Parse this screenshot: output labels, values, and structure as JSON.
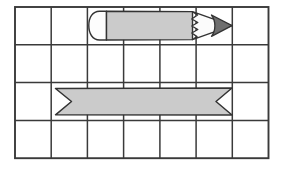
{
  "figure": {
    "background_color": "#ffffff",
    "width": 283,
    "height": 170
  },
  "grid": {
    "name": "measurement-grid",
    "columns": 7,
    "rows": 4,
    "x": 15,
    "y": 7,
    "cell_width": 36.2,
    "cell_height": 37.8,
    "line_color": "#3a3a3a",
    "outer_line_width": 1.8,
    "inner_line_width": 1.5,
    "fill_color": "#ffffff",
    "column_edges": [
      15,
      51.2,
      87.4,
      123.6,
      159.9,
      196.1,
      232.3,
      268.5
    ],
    "row_edges": [
      7,
      44.8,
      82.6,
      120.4,
      158.2
    ]
  },
  "objects": [
    {
      "name": "pencil",
      "label": "pencil",
      "row": 1,
      "start_column": 3,
      "end_column": 6,
      "span_columns": 4,
      "x_start": 92,
      "x_end": 232,
      "y_top": 11,
      "y_bottom": 40,
      "length_cells": 3.9,
      "body_color": "#cbcbcb",
      "eraser_color": "#fdfdfd",
      "wood_color": "#fbfbfb",
      "tip_color": "#6e6e6e",
      "outline_color": "#333333",
      "parts": [
        "eraser",
        "body",
        "zigzag-wood-edge",
        "graphite-tip"
      ]
    },
    {
      "name": "banner",
      "label": "banner",
      "row": 3,
      "start_column": 2,
      "end_column": 6,
      "span_columns": 5,
      "x_start": 55,
      "x_end": 232,
      "y_top": 88,
      "y_bottom": 115,
      "length_cells": 4.9,
      "fill_color": "#cbcbcb",
      "outline_color": "#333333",
      "end_style": "v-notch"
    }
  ]
}
